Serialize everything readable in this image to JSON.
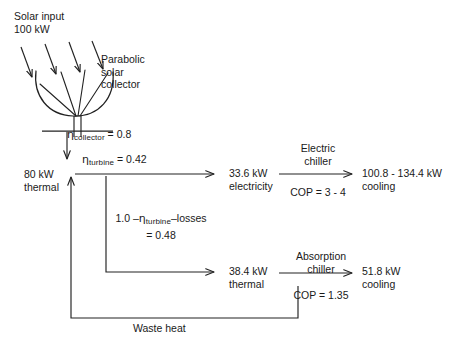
{
  "diagram": {
    "stroke_color": "#222222",
    "background_color": "#ffffff",
    "input": {
      "line1": "Solar input",
      "line2": "100 kW"
    },
    "collector": {
      "name_line1": "Parabolic",
      "name_line2": "solar",
      "name_line3": "collector",
      "efficiency_symbol": "η",
      "efficiency_subscript": "collector",
      "efficiency_value": " = 0.8"
    },
    "collector_output": {
      "line1": "80 kW",
      "line2": "thermal"
    },
    "turbine": {
      "efficiency_symbol": "η",
      "efficiency_subscript": "turbine",
      "efficiency_value": " = 0.42"
    },
    "loss_fraction": {
      "prefix": "1.0 –",
      "symbol": "η",
      "subscript": "turbine",
      "suffix": "–losses",
      "value": "= 0.48"
    },
    "electric_branch": {
      "stream_line1": "33.6 kW",
      "stream_line2": "electricity",
      "device_line1": "Electric",
      "device_line2": "chiller",
      "cop": "COP = 3 - 4",
      "output_line1": "100.8 - 134.4 kW",
      "output_line2": "cooling"
    },
    "absorption_branch": {
      "stream_line1": "38.4 kW",
      "stream_line2": "thermal",
      "device_line1": "Absorption",
      "device_line2": "chiller",
      "cop": "COP = 1.35",
      "output_line1": "51.8 kW",
      "output_line2": "cooling"
    },
    "waste_heat": {
      "label": "Waste heat"
    },
    "icons": {
      "sun_ray_arrow": "sun-ray-arrow-icon",
      "parabolic_dish": "parabolic-dish-icon",
      "flow_arrow": "flow-arrow-icon",
      "return_arrow": "return-arrow-icon"
    }
  }
}
